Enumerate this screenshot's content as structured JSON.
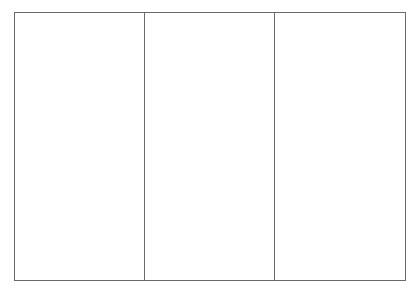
{
  "layout": {
    "type": "three-panel-frame",
    "panel_count": 3,
    "border_color": "#6a6a6a",
    "background_color": "#ffffff"
  },
  "panels": [
    {
      "label": ""
    },
    {
      "label": ""
    },
    {
      "label": ""
    }
  ]
}
